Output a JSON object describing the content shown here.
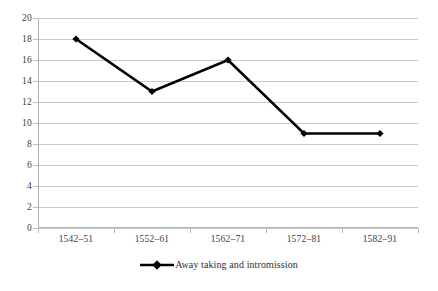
{
  "chart_data": {
    "type": "line",
    "title": "",
    "subtitle": "",
    "xlabel": "",
    "ylabel": "",
    "categories": [
      "1542–51",
      "1552–61",
      "1562–71",
      "1572–81",
      "1582–91"
    ],
    "series": [
      {
        "name": "Away taking and intromission",
        "values": [
          18,
          13,
          16,
          9,
          9
        ],
        "color": "#000000",
        "marker": "diamond",
        "line_width": 2.6
      }
    ],
    "ylim": [
      0,
      20
    ],
    "y_ticks": [
      0,
      2,
      4,
      6,
      8,
      10,
      12,
      14,
      16,
      18,
      20
    ],
    "y_tick_labels": [
      "0",
      "2",
      "4",
      "6",
      "8",
      "10",
      "12",
      "14",
      "16",
      "18",
      "20"
    ],
    "grid": {
      "horizontal": true,
      "vertical": false,
      "color": "#c9c9c9"
    },
    "legend": {
      "position": "bottom",
      "entries": [
        {
          "label": "Away taking and intromission",
          "marker": "diamond",
          "color": "#000000"
        }
      ]
    },
    "axis": {
      "line_color": "#b4b4b4",
      "tick_color": "#bdbdbd",
      "label_color": "#3d3d3d"
    },
    "plot_background": "#ffffff"
  }
}
